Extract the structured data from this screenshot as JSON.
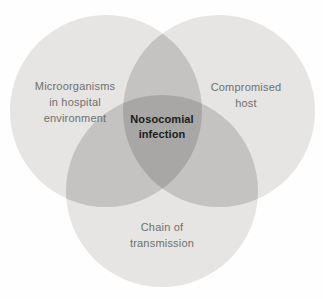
{
  "diagram": {
    "type": "venn-3-circle",
    "background": "#fefefe",
    "colors": {
      "single": "#e6e5e3",
      "pair_overlap": "#c4c3c1",
      "triple_overlap": "#a8a7a5",
      "label_text": "#6f6f6f",
      "center_label_text": "#1b1b1b"
    },
    "sets": [
      {
        "name": "Microorganisms in hospital environment",
        "lines": [
          "Microorganisms",
          "in hospital",
          "environment"
        ]
      },
      {
        "name": "Compromised host",
        "lines": [
          "Compromised",
          "host"
        ]
      },
      {
        "name": "Chain of transmission",
        "lines": [
          "Chain of",
          "transmission"
        ]
      }
    ],
    "intersection_label": {
      "name": "Nosocomial infection",
      "lines": [
        "Nosocomial",
        "infection"
      ]
    }
  }
}
